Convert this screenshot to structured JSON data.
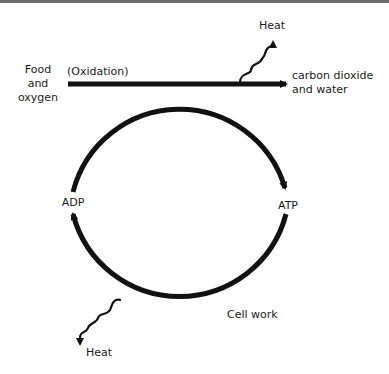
{
  "diagram": {
    "labels": {
      "input": [
        "Food",
        "and",
        "oxygen"
      ],
      "process": "(Oxidation)",
      "output": [
        "carbon dioxide",
        "and water"
      ],
      "heat_top": "Heat",
      "heat_bottom": "Heat",
      "left_node": "ADP",
      "right_node": "ATP",
      "cell_work": "Cell work"
    },
    "edges": [
      {
        "from": "Food and oxygen",
        "to": "carbon dioxide and water",
        "label": "(Oxidation)"
      },
      {
        "from": "Oxidation",
        "to": "Heat"
      },
      {
        "from": "ADP",
        "to": "ATP",
        "direction": "clockwise via top"
      },
      {
        "from": "ATP",
        "to": "ADP",
        "direction": "clockwise via bottom",
        "label": "Cell work"
      },
      {
        "from": "Cell work",
        "to": "Heat"
      }
    ],
    "colors": {
      "stroke": "#111111",
      "text": "#1a1a1a"
    }
  }
}
